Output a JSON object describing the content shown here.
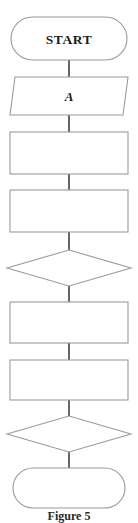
{
  "figure": {
    "caption": "Figure 5",
    "background_color": "#ffffff",
    "shape_stroke_color": "#9a9a9a",
    "connector_color": "#55555a",
    "text_color": "#1a1a1a"
  },
  "flowchart": {
    "orientation": "vertical",
    "nodes": [
      {
        "id": "start",
        "shape": "terminator",
        "label": "START",
        "name": "terminator-start"
      },
      {
        "id": "input-a",
        "shape": "parallelogram",
        "label": "A",
        "name": "io-parallelogram-a"
      },
      {
        "id": "process-1",
        "shape": "rectangle",
        "label": "",
        "name": "process-box-1"
      },
      {
        "id": "process-2",
        "shape": "rectangle",
        "label": "",
        "name": "process-box-2"
      },
      {
        "id": "decision-1",
        "shape": "diamond",
        "label": "",
        "name": "decision-diamond-1"
      },
      {
        "id": "process-3",
        "shape": "rectangle",
        "label": "",
        "name": "process-box-3"
      },
      {
        "id": "process-4",
        "shape": "rectangle",
        "label": "",
        "name": "process-box-4"
      },
      {
        "id": "decision-2",
        "shape": "diamond",
        "label": "",
        "name": "decision-diamond-2"
      },
      {
        "id": "end",
        "shape": "terminator",
        "label": "",
        "name": "terminator-end"
      }
    ],
    "connectors": [
      {
        "from": "start",
        "to": "input-a"
      },
      {
        "from": "input-a",
        "to": "process-1"
      },
      {
        "from": "process-1",
        "to": "process-2"
      },
      {
        "from": "process-2",
        "to": "decision-1"
      },
      {
        "from": "decision-1",
        "to": "process-3"
      },
      {
        "from": "process-3",
        "to": "process-4"
      },
      {
        "from": "process-4",
        "to": "decision-2"
      },
      {
        "from": "decision-2",
        "to": "end"
      }
    ]
  }
}
